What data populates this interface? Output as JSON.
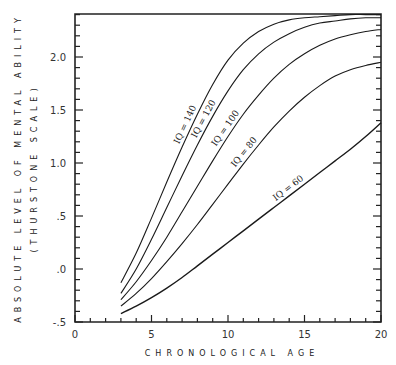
{
  "chart_data": {
    "type": "line",
    "title": "",
    "xlabel": "CHRONOLOGICAL AGE",
    "ylabel": "ABSOLUTE LEVEL OF MENTAL ABILITY",
    "ylabel_sub": "(THURSTONE SCALE)",
    "xlim": [
      0,
      20
    ],
    "ylim": [
      -0.5,
      2.4
    ],
    "x_ticks": [
      0,
      5,
      10,
      15,
      20
    ],
    "x_tick_labels": [
      "0",
      "5",
      "10",
      "15",
      "20"
    ],
    "y_ticks": [
      -0.5,
      0.0,
      0.5,
      1.0,
      1.5,
      2.0
    ],
    "y_tick_labels": [
      "-.5",
      ".0",
      ".5",
      "1.0",
      "1.5",
      "2.0"
    ],
    "grid": false,
    "legend": "inline curve labels",
    "x": [
      3,
      4,
      5,
      6,
      7,
      8,
      9,
      10,
      11,
      12,
      13,
      14,
      15,
      16,
      17,
      18,
      19,
      20
    ],
    "series": [
      {
        "name": "IQ = 140",
        "values": [
          -0.13,
          0.15,
          0.48,
          0.82,
          1.15,
          1.46,
          1.74,
          1.97,
          2.13,
          2.24,
          2.31,
          2.35,
          2.37,
          2.38,
          2.39,
          2.4,
          2.4,
          2.4
        ]
      },
      {
        "name": "IQ = 120",
        "values": [
          -0.23,
          0.0,
          0.28,
          0.58,
          0.88,
          1.17,
          1.44,
          1.68,
          1.88,
          2.03,
          2.14,
          2.22,
          2.28,
          2.32,
          2.34,
          2.36,
          2.37,
          2.37
        ]
      },
      {
        "name": "IQ = 100",
        "values": [
          -0.29,
          -0.12,
          0.08,
          0.3,
          0.54,
          0.78,
          1.02,
          1.25,
          1.46,
          1.64,
          1.8,
          1.93,
          2.03,
          2.11,
          2.17,
          2.21,
          2.24,
          2.26
        ]
      },
      {
        "name": "IQ = 80",
        "values": [
          -0.35,
          -0.23,
          -0.09,
          0.07,
          0.24,
          0.42,
          0.61,
          0.8,
          0.99,
          1.17,
          1.34,
          1.49,
          1.62,
          1.73,
          1.82,
          1.88,
          1.92,
          1.95
        ]
      },
      {
        "name": "IQ = 60",
        "values": [
          -0.42,
          -0.35,
          -0.27,
          -0.18,
          -0.08,
          0.03,
          0.14,
          0.25,
          0.36,
          0.47,
          0.58,
          0.69,
          0.8,
          0.91,
          1.02,
          1.13,
          1.25,
          1.38
        ]
      }
    ]
  }
}
